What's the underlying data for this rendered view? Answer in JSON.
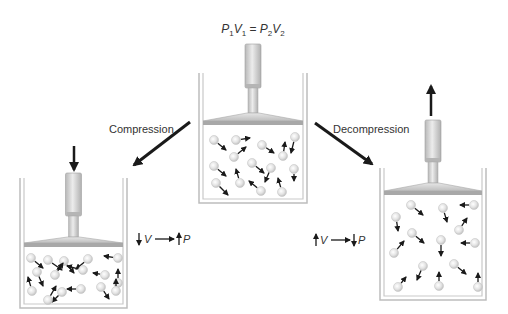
{
  "title": {
    "equation_parts": [
      "P",
      "1",
      "V",
      "1",
      " = ",
      "P",
      "2",
      "V",
      "2"
    ]
  },
  "labels": {
    "compression": "Compression",
    "decompression": "Decompression"
  },
  "relations": {
    "compression": {
      "left_arrow": "down",
      "left_var": "V",
      "right_arrow": "up",
      "right_var": "P"
    },
    "decompression": {
      "left_arrow": "up",
      "left_var": "V",
      "right_arrow": "down",
      "right_var": "P"
    }
  },
  "containers": [
    {
      "id": "initial",
      "state": "initial",
      "molecule_count": 16,
      "piston_force": "none"
    },
    {
      "id": "compressed",
      "state": "compression",
      "molecule_count": 16,
      "piston_force": "down"
    },
    {
      "id": "decompressed",
      "state": "decompression",
      "molecule_count": 16,
      "piston_force": "up"
    }
  ],
  "colors": {
    "arrow": "#1a1a1a",
    "wall": "#bdbdbd",
    "piston": "#d6d6d6",
    "piston_plate": "#a8a8a8",
    "molecule": "#d9d9d9",
    "text": "#333333"
  }
}
